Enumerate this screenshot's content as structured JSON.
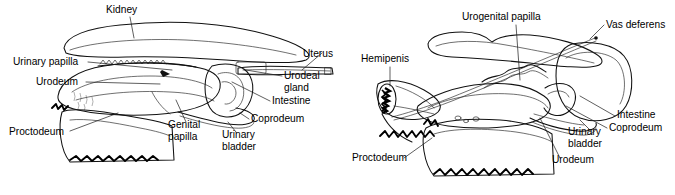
{
  "figure": {
    "background_color": "#ffffff",
    "ink_color": "#111111",
    "panels": [
      {
        "id": "female",
        "name": "female-cloaca-diagram",
        "labels": [
          {
            "id": "kidney",
            "text": "Kidney",
            "x": 106,
            "y": 13,
            "anchor": "start"
          },
          {
            "id": "urinary-papilla",
            "text": "Urinary papilla",
            "x": 13,
            "y": 65,
            "anchor": "start"
          },
          {
            "id": "urodeum",
            "text": "Urodeum",
            "x": 36,
            "y": 85,
            "anchor": "start"
          },
          {
            "id": "proctodeum",
            "text": "Proctodeum",
            "x": 9,
            "y": 135,
            "anchor": "start"
          },
          {
            "id": "genital-papilla",
            "text_line1": "Genital",
            "text_line2": "papilla",
            "x": 168,
            "y": 128,
            "anchor": "start"
          },
          {
            "id": "urinary-bladder",
            "text_line1": "Urinary",
            "text_line2": "bladder",
            "x": 222,
            "y": 138,
            "anchor": "start"
          },
          {
            "id": "uterus",
            "text": "Uterus",
            "x": 303,
            "y": 57,
            "anchor": "start"
          },
          {
            "id": "urodeal-gland",
            "text_line1": "Urodeal",
            "text_line2": "gland",
            "x": 284,
            "y": 79,
            "anchor": "start"
          },
          {
            "id": "intestine",
            "text": "Intestine",
            "x": 272,
            "y": 104,
            "anchor": "start"
          },
          {
            "id": "coprodeum",
            "text": "Coprodeum",
            "x": 251,
            "y": 122,
            "anchor": "start"
          }
        ]
      },
      {
        "id": "male",
        "name": "male-cloaca-diagram",
        "labels": [
          {
            "id": "urogenital-papilla",
            "text": "Urogenital papilla",
            "x": 462,
            "y": 20,
            "anchor": "start"
          },
          {
            "id": "vas-deferens",
            "text": "Vas deferens",
            "x": 606,
            "y": 28,
            "anchor": "start"
          },
          {
            "id": "hemipenis",
            "text": "Hemipenis",
            "x": 361,
            "y": 62,
            "anchor": "start"
          },
          {
            "id": "intestine",
            "text": "Intestine",
            "x": 617,
            "y": 118,
            "anchor": "start"
          },
          {
            "id": "coprodeum",
            "text": "Coprodeum",
            "x": 609,
            "y": 131,
            "anchor": "start"
          },
          {
            "id": "urinary-bladder",
            "text_line1": "Urinary",
            "text_line2": "bladder",
            "x": 568,
            "y": 135,
            "anchor": "start"
          },
          {
            "id": "urodeum",
            "text": "Urodeum",
            "x": 552,
            "y": 163,
            "anchor": "start"
          },
          {
            "id": "proctodeum",
            "text": "Proctodeum",
            "x": 352,
            "y": 161,
            "anchor": "start"
          }
        ]
      }
    ]
  }
}
